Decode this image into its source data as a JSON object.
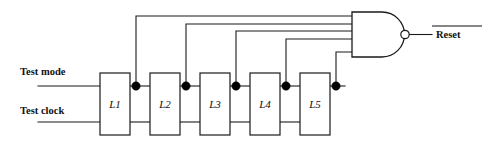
{
  "diagram": {
    "type": "logic-circuit-schematic",
    "background_color": "#ffffff",
    "line_color": "#1a1a1a",
    "width": 493,
    "height": 149
  },
  "inputs": [
    {
      "id": "test-mode",
      "label": "Test mode",
      "label_x": 20,
      "label_y": 75,
      "wire_y": 86
    },
    {
      "id": "test-clock",
      "label": "Test clock",
      "label_x": 20,
      "label_y": 114,
      "wire_y": 122
    }
  ],
  "latches": [
    {
      "id": "L1",
      "label": "L1",
      "x": 100,
      "y": 73,
      "w": 30,
      "h": 62
    },
    {
      "id": "L2",
      "label": "L2",
      "x": 150,
      "y": 73,
      "w": 30,
      "h": 62
    },
    {
      "id": "L3",
      "label": "L3",
      "x": 200,
      "y": 73,
      "w": 30,
      "h": 62
    },
    {
      "id": "L4",
      "label": "L4",
      "x": 250,
      "y": 73,
      "w": 30,
      "h": 62
    },
    {
      "id": "L5",
      "label": "L5",
      "x": 300,
      "y": 73,
      "w": 30,
      "h": 62
    }
  ],
  "junctions": [
    {
      "id": "j1",
      "x": 136,
      "y": 86,
      "r": 4.2
    },
    {
      "id": "j2",
      "x": 186,
      "y": 86,
      "r": 4.2
    },
    {
      "id": "j3",
      "x": 236,
      "y": 86,
      "r": 4.2
    },
    {
      "id": "j4",
      "x": 286,
      "y": 86,
      "r": 4.2
    },
    {
      "id": "j5",
      "x": 336,
      "y": 86,
      "r": 4.2
    }
  ],
  "feedback_lines": [
    {
      "id": "fb1",
      "from_junction": "j1",
      "rail_y": 16,
      "x": 136
    },
    {
      "id": "fb2",
      "from_junction": "j2",
      "rail_y": 24,
      "x": 186
    },
    {
      "id": "fb3",
      "from_junction": "j3",
      "rail_y": 31,
      "x": 236
    },
    {
      "id": "fb4",
      "from_junction": "j4",
      "rail_y": 39,
      "x": 286
    },
    {
      "id": "fb5",
      "from_junction": "j5",
      "rail_y": 52,
      "x": 336
    }
  ],
  "gate": {
    "id": "nand-gate",
    "type": "NAND",
    "inputs_count": 5,
    "body_x": 352,
    "body_y": 12,
    "body_w": 30,
    "body_h": 45,
    "arc_radius": 22.5,
    "bubble_x": 405,
    "bubble_y": 34.5,
    "bubble_r": 4.2
  },
  "output": {
    "id": "reset-output",
    "label": "Reset",
    "active_low": true,
    "wire_y": 34.5,
    "wire_x_start": 409,
    "wire_x_end": 432,
    "label_x": 436,
    "label_y": 38,
    "overbar_x1": 432,
    "overbar_x2": 482,
    "overbar_y": 26
  }
}
